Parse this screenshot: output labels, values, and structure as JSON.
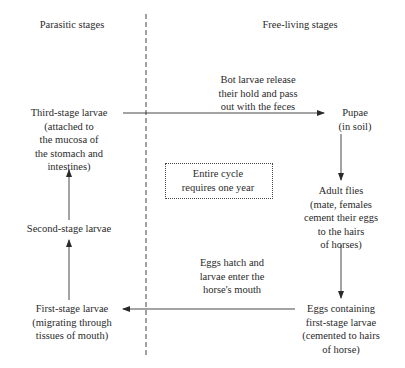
{
  "headers": {
    "left": "Parasitic stages",
    "right": "Free-living stages"
  },
  "nodes": {
    "third_stage": [
      "Third-stage larvae",
      "(attached to",
      "the mucosa of",
      "the stomach and",
      "intestines)"
    ],
    "pupae": [
      "Pupae",
      "(in soil)"
    ],
    "adult_flies": [
      "Adult flies",
      "(mate, females",
      "cement their eggs",
      "to the hairs",
      "of horses)"
    ],
    "eggs": [
      "Eggs containing",
      "first-stage larvae",
      "(cemented to hairs",
      "of horse)"
    ],
    "first_stage": [
      "First-stage larvae",
      "(migrating through",
      "tissues of mouth)"
    ],
    "second_stage": [
      "Second-stage larvae"
    ]
  },
  "edge_labels": {
    "third_to_pupae": [
      "Bot larvae release",
      "their hold and pass",
      "out with the feces"
    ],
    "eggs_to_first": [
      "Eggs hatch and",
      "larvae enter the",
      "horse's mouth"
    ]
  },
  "note": [
    "Entire cycle",
    "requires one year"
  ]
}
